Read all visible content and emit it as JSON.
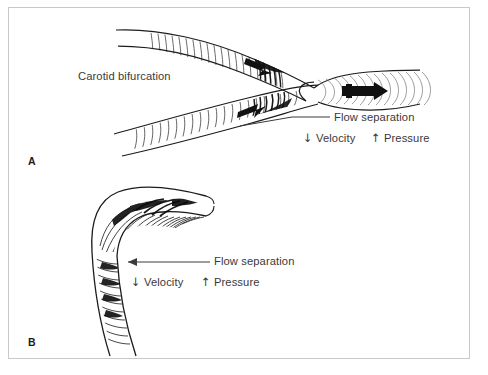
{
  "figure": {
    "kind": "medical-illustration",
    "border_color": "#c9c9c9",
    "background_color": "#ffffff",
    "ink_color": "#1c1c1c",
    "text_color": "#39393b"
  },
  "panel_a": {
    "letter": "A",
    "bifurcation_label": "Carotid bifurcation",
    "flow_separation_label": "Flow separation",
    "velocity_arrow": "↓",
    "velocity_label": "Velocity",
    "pressure_arrow": "↑",
    "pressure_label": "Pressure"
  },
  "panel_b": {
    "letter": "B",
    "flow_separation_label": "Flow separation",
    "velocity_arrow": "↓",
    "velocity_label": "Velocity",
    "pressure_arrow": "↑",
    "pressure_label": "Pressure"
  }
}
